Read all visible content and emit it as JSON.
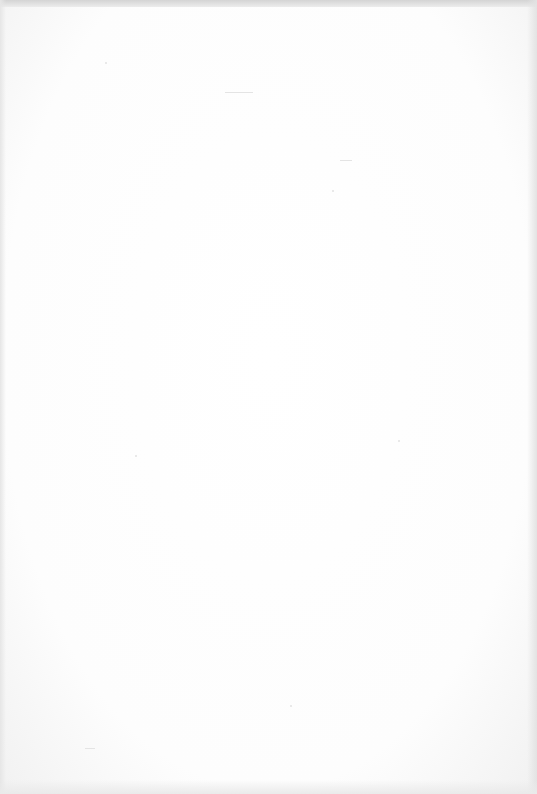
{
  "document": {
    "type": "scanned-page",
    "content_state": "blank",
    "header_mark": {
      "text": "",
      "legibility": "illegible"
    },
    "body_text": ""
  },
  "colors": {
    "paper": "#ffffff",
    "scan_edge": "#d4d4d4",
    "faint_marks": "#e2e2e2"
  }
}
